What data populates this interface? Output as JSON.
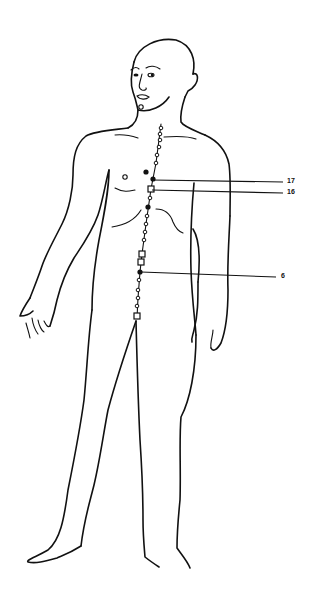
{
  "figure": {
    "ink_color": "#111111",
    "background": "#ffffff"
  },
  "labels": [
    {
      "text": "17",
      "x": 287,
      "y": 181,
      "line_from": [
        152,
        180
      ],
      "line_to": [
        283,
        182
      ]
    },
    {
      "text": "16",
      "x": 287,
      "y": 192,
      "line_from": [
        152,
        190
      ],
      "line_to": [
        283,
        193
      ]
    },
    {
      "text": "6",
      "x": 281,
      "y": 276,
      "line_from": [
        141,
        272
      ],
      "line_to": [
        276,
        277
      ]
    }
  ],
  "meridian_points": [
    {
      "type": "circle",
      "x": 161,
      "y": 128
    },
    {
      "type": "circle",
      "x": 160,
      "y": 134
    },
    {
      "type": "circle",
      "x": 160,
      "y": 140
    },
    {
      "type": "circle",
      "x": 159,
      "y": 147
    },
    {
      "type": "circle",
      "x": 157,
      "y": 155
    },
    {
      "type": "circle",
      "x": 156,
      "y": 163
    },
    {
      "type": "dot",
      "x": 146,
      "y": 172
    },
    {
      "type": "dot",
      "x": 153,
      "y": 179
    },
    {
      "type": "square",
      "x": 151,
      "y": 189
    },
    {
      "type": "circle",
      "x": 150,
      "y": 198
    },
    {
      "type": "dot",
      "x": 148,
      "y": 207
    },
    {
      "type": "circle",
      "x": 147,
      "y": 216
    },
    {
      "type": "circle",
      "x": 146,
      "y": 224
    },
    {
      "type": "circle",
      "x": 145,
      "y": 232
    },
    {
      "type": "circle",
      "x": 144,
      "y": 240
    },
    {
      "type": "square",
      "x": 142,
      "y": 254
    },
    {
      "type": "square",
      "x": 141,
      "y": 262
    },
    {
      "type": "dot",
      "x": 140,
      "y": 272
    },
    {
      "type": "circle",
      "x": 139,
      "y": 280
    },
    {
      "type": "circle",
      "x": 138,
      "y": 290
    },
    {
      "type": "circle",
      "x": 138,
      "y": 298
    },
    {
      "type": "circle",
      "x": 137,
      "y": 306
    },
    {
      "type": "square",
      "x": 137,
      "y": 316
    }
  ]
}
